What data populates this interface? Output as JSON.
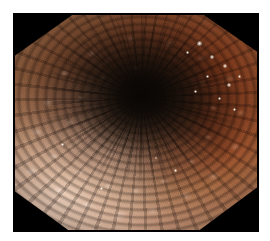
{
  "viewer": {
    "name": "endoscopy-image-viewer",
    "background_color": "#ffffff",
    "canvas_width": 270,
    "canvas_height": 241,
    "alt_text": "Endoscopic view of colonic lumen with nodular cobblestone mucosa"
  },
  "image": {
    "modality": "endoscopy",
    "view": "colonic lumen, en face",
    "frame": {
      "x": 13,
      "y": 13,
      "width": 246,
      "height": 219
    },
    "mask_shape": "octagonal",
    "mask_color": "#000000",
    "lumen": {
      "center_x_pct": 52,
      "center_y_pct": 39,
      "core_color": "#0a0603"
    },
    "palette": {
      "mucosa_bright": "#ddbca6",
      "mucosa_pale_pink": "#d9b9a5",
      "mucosa_salmon": "#e8c4b1",
      "mucosa_mid": "#c08e6f",
      "mucosa_rust": "#8d5c3c",
      "mucosa_deep": "#4a2c1c",
      "groove_dark": "#1a120c",
      "lumen_black": "#120d09",
      "specular_white": "#fffffc",
      "cool_grey": "#b0aaac",
      "background_white": "#ffffff"
    },
    "texture": {
      "pattern": "cobblestone-nodular",
      "fold_orientation": "radial-converging",
      "highlight_quadrant": "lower-left",
      "shadow_quadrant": "center"
    },
    "specular_highlights": [
      {
        "left_pct": 76,
        "top_pct": 14,
        "size_px": 5
      },
      {
        "left_pct": 81,
        "top_pct": 20,
        "size_px": 4
      },
      {
        "left_pct": 86,
        "top_pct": 24,
        "size_px": 4
      },
      {
        "left_pct": 79,
        "top_pct": 29,
        "size_px": 3
      },
      {
        "left_pct": 88,
        "top_pct": 33,
        "size_px": 4
      },
      {
        "left_pct": 84,
        "top_pct": 39,
        "size_px": 3
      },
      {
        "left_pct": 92,
        "top_pct": 29,
        "size_px": 3
      },
      {
        "left_pct": 71,
        "top_pct": 18,
        "size_px": 3
      },
      {
        "left_pct": 90,
        "top_pct": 44,
        "size_px": 3
      },
      {
        "left_pct": 74,
        "top_pct": 36,
        "size_px": 3
      },
      {
        "left_pct": 66,
        "top_pct": 72,
        "size_px": 3
      },
      {
        "left_pct": 58,
        "top_pct": 66,
        "size_px": 2
      },
      {
        "left_pct": 20,
        "top_pct": 60,
        "size_px": 3
      },
      {
        "left_pct": 36,
        "top_pct": 80,
        "size_px": 3
      }
    ]
  }
}
